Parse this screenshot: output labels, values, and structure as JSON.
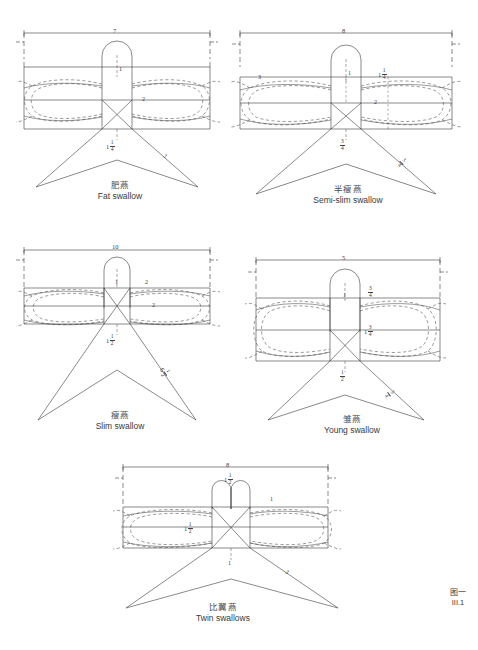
{
  "page": {
    "background": "#ffffff",
    "ink": "#333333",
    "plate": {
      "cn": "图一",
      "num": "III.1"
    }
  },
  "figures": [
    {
      "id": "fat-swallow",
      "name_cn": "肥燕",
      "name_en": "Fat swallow",
      "labels": {
        "top_width": "7",
        "head": "1",
        "wing": "2",
        "center": {
          "whole": "1",
          "num": "1",
          "den": "4"
        },
        "tail": "3"
      }
    },
    {
      "id": "semi-slim-swallow",
      "name_cn": "半瘦燕",
      "name_en": "Semi-slim swallow",
      "labels": {
        "top_width": "8",
        "head": "1",
        "head_side": {
          "whole": "1",
          "num": "1",
          "den": "4"
        },
        "wing_left": "3",
        "wing": "2",
        "center": {
          "num": "3",
          "den": "4"
        },
        "tail": {
          "num": "3",
          "den": "4"
        }
      }
    },
    {
      "id": "slim-swallow",
      "name_cn": "瘦燕",
      "name_en": "Slim swallow",
      "labels": {
        "top_width": "10",
        "head": "1",
        "head_side": "2",
        "wing": "2",
        "center": {
          "whole": "1",
          "num": "1",
          "den": "2"
        },
        "tail": {
          "whole": "6",
          "num": "1",
          "den": "2"
        }
      }
    },
    {
      "id": "young-swallow",
      "name_cn": "雏燕",
      "name_en": "Young swallow",
      "labels": {
        "top_width": "5",
        "head": "1",
        "head_side": {
          "num": "3",
          "den": "4"
        },
        "wing": {
          "whole": "1",
          "num": "3",
          "den": "4"
        },
        "center": {
          "num": "1",
          "den": "2"
        },
        "tail": {
          "num": "3",
          "den": "4"
        }
      }
    },
    {
      "id": "twin-swallows",
      "name_cn": "比翼燕",
      "name_en": "Twin swallows",
      "labels": {
        "top_width": "8",
        "head_top": {
          "whole": "1",
          "num": "1",
          "den": "2"
        },
        "head_side": "1",
        "wing": {
          "whole": "1",
          "num": "1",
          "den": "2"
        },
        "center": "1",
        "tail": "3"
      }
    }
  ]
}
